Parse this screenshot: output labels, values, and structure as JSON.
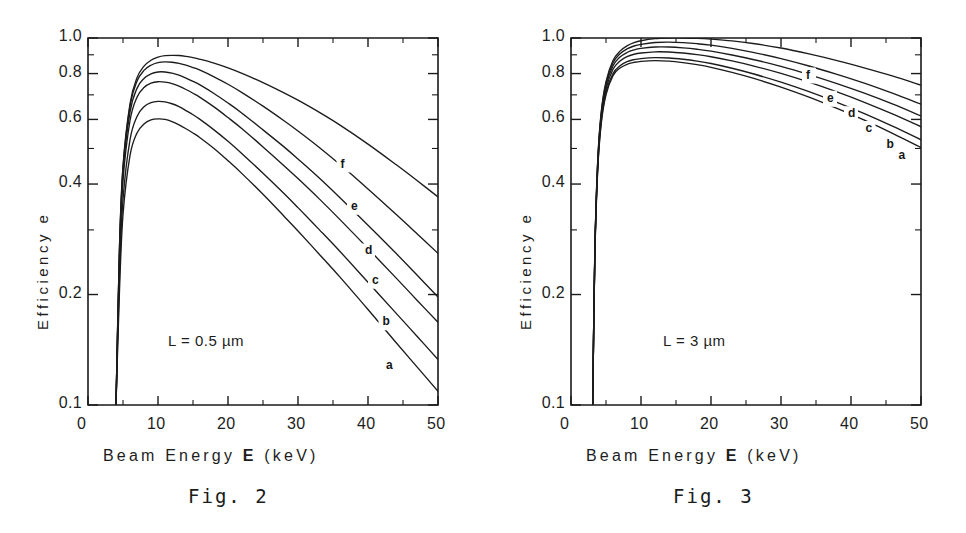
{
  "page": {
    "background": "#ffffff",
    "ink": "#1a1a1a"
  },
  "figures": [
    {
      "id": "fig2",
      "caption": "Fig.  2",
      "annotation": "L = 0.5 µm",
      "axis_title_y": "Efficiency  e",
      "axis_title_x_pre": "Beam  Energy  ",
      "axis_title_x_sym": "E",
      "axis_title_x_post": "  (keV)",
      "chart_data": {
        "type": "line",
        "title": "Fig. 2",
        "subtitle": "L = 0.5 µm",
        "xlabel": "Beam Energy E (keV)",
        "ylabel": "Efficiency e",
        "xlim": [
          0,
          50
        ],
        "ylim": [
          0.1,
          1.0
        ],
        "yscale": "log",
        "xscale": "linear",
        "grid": false,
        "legend": "inline-curve-end-labels",
        "xticks": [
          0,
          10,
          20,
          30,
          40,
          50
        ],
        "xticklabels": [
          "0",
          "10",
          "20",
          "30",
          "40",
          "50"
        ],
        "xminorticks": [
          5,
          15,
          25,
          35,
          45
        ],
        "yticks": [
          0.1,
          0.2,
          0.4,
          0.6,
          0.8,
          1.0
        ],
        "yticklabels": [
          "0.1",
          "0.2",
          "0.4",
          "0.6",
          "0.8",
          "1.0"
        ],
        "yminorticks": [
          0.3,
          0.5,
          0.7,
          0.9
        ],
        "x": [
          4,
          4.5,
          5,
          6,
          7,
          8,
          9,
          10,
          11,
          12,
          13,
          14,
          15,
          16,
          18,
          20,
          22,
          25,
          28,
          30,
          33,
          36,
          40,
          44,
          47,
          50
        ],
        "series": [
          {
            "name": "a",
            "label": "a",
            "label_x": 43.0,
            "label_y": 0.128,
            "values": [
              0.1,
              0.205,
              0.33,
              0.478,
              0.551,
              0.583,
              0.598,
              0.602,
              0.6,
              0.592,
              0.58,
              0.566,
              0.551,
              0.535,
              0.5,
              0.463,
              0.427,
              0.375,
              0.327,
              0.298,
              0.258,
              0.223,
              0.182,
              0.148,
              0.127,
              0.109
            ]
          },
          {
            "name": "b",
            "label": "b",
            "label_x": 42.5,
            "label_y": 0.168,
            "values": [
              0.1,
              0.225,
              0.363,
              0.528,
              0.611,
              0.65,
              0.667,
              0.672,
              0.67,
              0.662,
              0.65,
              0.634,
              0.618,
              0.6,
              0.562,
              0.523,
              0.484,
              0.428,
              0.377,
              0.345,
              0.301,
              0.262,
              0.216,
              0.178,
              0.154,
              0.133
            ]
          },
          {
            "name": "c",
            "label": "c",
            "label_x": 41.0,
            "label_y": 0.218,
            "values": [
              0.1,
              0.25,
              0.408,
              0.595,
              0.69,
              0.733,
              0.753,
              0.76,
              0.758,
              0.751,
              0.739,
              0.724,
              0.707,
              0.689,
              0.649,
              0.607,
              0.566,
              0.505,
              0.449,
              0.414,
              0.365,
              0.32,
              0.267,
              0.222,
              0.193,
              0.168
            ]
          },
          {
            "name": "d",
            "label": "d",
            "label_x": 40.0,
            "label_y": 0.262,
            "values": [
              0.1,
              0.262,
              0.43,
              0.628,
              0.729,
              0.776,
              0.799,
              0.808,
              0.808,
              0.802,
              0.792,
              0.778,
              0.762,
              0.745,
              0.706,
              0.665,
              0.624,
              0.562,
              0.505,
              0.468,
              0.416,
              0.367,
              0.309,
              0.259,
              0.226,
              0.197
            ]
          },
          {
            "name": "e",
            "label": "e",
            "label_x": 38.0,
            "label_y": 0.347,
            "values": [
              0.1,
              0.268,
              0.443,
              0.652,
              0.762,
              0.816,
              0.843,
              0.857,
              0.861,
              0.859,
              0.853,
              0.843,
              0.831,
              0.817,
              0.784,
              0.748,
              0.71,
              0.652,
              0.595,
              0.558,
              0.504,
              0.452,
              0.388,
              0.331,
              0.293,
              0.259
            ]
          },
          {
            "name": "f",
            "label": "f",
            "label_x": 36.5,
            "label_y": 0.452,
            "values": [
              0.1,
              0.27,
              0.448,
              0.662,
              0.779,
              0.838,
              0.87,
              0.887,
              0.895,
              0.897,
              0.896,
              0.891,
              0.884,
              0.875,
              0.854,
              0.829,
              0.801,
              0.756,
              0.709,
              0.677,
              0.628,
              0.579,
              0.514,
              0.452,
              0.409,
              0.369
            ]
          }
        ]
      }
    },
    {
      "id": "fig3",
      "caption": "Fig.  3",
      "annotation": "L = 3 µm",
      "axis_title_y": "Efficiency  e",
      "axis_title_x_pre": "Beam  Energy  ",
      "axis_title_x_sym": "E",
      "axis_title_x_post": "  (keV)",
      "chart_data": {
        "type": "line",
        "title": "Fig. 3",
        "subtitle": "L = 3 µm",
        "xlabel": "Beam Energy E (keV)",
        "ylabel": "Efficiency e",
        "xlim": [
          0,
          50
        ],
        "ylim": [
          0.1,
          1.0
        ],
        "yscale": "log",
        "xscale": "linear",
        "grid": false,
        "legend": "inline-curve-end-labels",
        "xticks": [
          0,
          10,
          20,
          30,
          40,
          50
        ],
        "xticklabels": [
          "0",
          "10",
          "20",
          "30",
          "40",
          "50"
        ],
        "xminorticks": [
          5,
          15,
          25,
          35,
          45
        ],
        "yticks": [
          0.1,
          0.2,
          0.4,
          0.6,
          0.8,
          1.0
        ],
        "yticklabels": [
          "0.1",
          "0.2",
          "0.4",
          "0.6",
          "0.8",
          "1.0"
        ],
        "yminorticks": [
          0.3,
          0.5,
          0.7,
          0.9
        ],
        "x": [
          3.1,
          3.4,
          3.8,
          4.3,
          5,
          6,
          7,
          8,
          9,
          10,
          12,
          14,
          16,
          18,
          20,
          23,
          26,
          30,
          34,
          38,
          42,
          46,
          50
        ],
        "series": [
          {
            "name": "a",
            "label": "a",
            "label_x": 47.2,
            "label_y": 0.478,
            "values": [
              0.1,
              0.25,
              0.43,
              0.58,
              0.7,
              0.79,
              0.828,
              0.848,
              0.858,
              0.864,
              0.868,
              0.865,
              0.857,
              0.846,
              0.832,
              0.806,
              0.777,
              0.735,
              0.69,
              0.643,
              0.596,
              0.549,
              0.503
            ]
          },
          {
            "name": "b",
            "label": "b",
            "label_x": 45.5,
            "label_y": 0.512,
            "values": [
              0.1,
              0.252,
              0.435,
              0.588,
              0.71,
              0.8,
              0.84,
              0.862,
              0.873,
              0.879,
              0.884,
              0.882,
              0.875,
              0.865,
              0.852,
              0.827,
              0.799,
              0.758,
              0.714,
              0.668,
              0.621,
              0.574,
              0.528
            ]
          },
          {
            "name": "c",
            "label": "c",
            "label_x": 42.5,
            "label_y": 0.565,
            "values": [
              0.1,
              0.255,
              0.442,
              0.6,
              0.726,
              0.822,
              0.866,
              0.89,
              0.903,
              0.91,
              0.917,
              0.916,
              0.91,
              0.901,
              0.889,
              0.866,
              0.84,
              0.801,
              0.758,
              0.713,
              0.667,
              0.62,
              0.573
            ]
          },
          {
            "name": "d",
            "label": "d",
            "label_x": 40.0,
            "label_y": 0.62,
            "values": [
              0.1,
              0.257,
              0.448,
              0.61,
              0.74,
              0.84,
              0.887,
              0.913,
              0.928,
              0.937,
              0.945,
              0.945,
              0.94,
              0.932,
              0.921,
              0.899,
              0.874,
              0.837,
              0.795,
              0.751,
              0.706,
              0.66,
              0.613
            ]
          },
          {
            "name": "e",
            "label": "e",
            "label_x": 37.0,
            "label_y": 0.683,
            "values": [
              0.1,
              0.259,
              0.452,
              0.618,
              0.752,
              0.856,
              0.906,
              0.934,
              0.951,
              0.961,
              0.972,
              0.974,
              0.971,
              0.965,
              0.956,
              0.937,
              0.914,
              0.879,
              0.839,
              0.796,
              0.752,
              0.706,
              0.66
            ]
          },
          {
            "name": "f",
            "label": "f",
            "label_x": 34.0,
            "label_y": 0.79,
            "values": [
              0.1,
              0.26,
              0.455,
              0.624,
              0.76,
              0.868,
              0.921,
              0.952,
              0.971,
              0.983,
              0.996,
              1.0,
              1.0,
              0.998,
              0.993,
              0.982,
              0.966,
              0.939,
              0.905,
              0.868,
              0.828,
              0.787,
              0.744
            ]
          }
        ]
      }
    }
  ]
}
